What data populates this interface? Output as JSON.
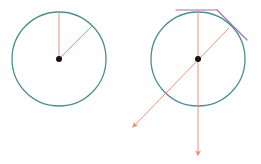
{
  "colors": {
    "circle": "#4a8f92",
    "radius_line": "#f0907a",
    "tangent": "#a070b0",
    "center": "#111111",
    "background": "#ffffff"
  },
  "figures": [
    {
      "name": "circle-with-radii",
      "center": [
        59,
        59
      ],
      "radius": 47,
      "lines": [
        {
          "from": [
            59,
            59
          ],
          "to": [
            59,
            12
          ]
        },
        {
          "from": [
            59,
            59
          ],
          "to": [
            92,
            26
          ]
        }
      ]
    },
    {
      "name": "circle-with-tangents-and-arrows",
      "center": [
        198,
        59
      ],
      "radius": 47,
      "lines": [
        {
          "from": [
            198,
            10
          ],
          "to": [
            198,
            155
          ],
          "arrow": true
        },
        {
          "from": [
            229,
            28
          ],
          "to": [
            133,
            127
          ],
          "arrow": true
        }
      ],
      "tangents": [
        {
          "from": [
            176,
            10
          ],
          "to": [
            217,
            10
          ]
        },
        {
          "from": [
            217,
            10
          ],
          "to": [
            247,
            40
          ]
        }
      ]
    }
  ]
}
